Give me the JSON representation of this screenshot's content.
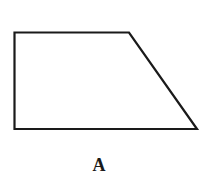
{
  "figure": {
    "shape": "trapezoid",
    "label": "A",
    "vertices": [
      [
        14,
        32
      ],
      [
        129,
        32
      ],
      [
        197,
        129
      ],
      [
        14,
        129
      ]
    ],
    "stroke_color": "#1a1a1a",
    "fill_color": "#ffffff"
  }
}
